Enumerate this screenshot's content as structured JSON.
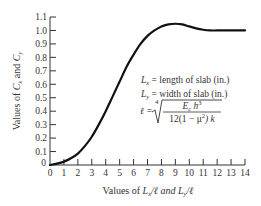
{
  "chart_data": {
    "type": "line",
    "title": "",
    "xlabel": "Values of Lx/ℓ and Ly/ℓ",
    "ylabel": "Values of Cx and Cy",
    "xlim": [
      0,
      14
    ],
    "ylim": [
      0,
      1.1
    ],
    "grid": false,
    "legend": null,
    "x_ticks": [
      0,
      1,
      2,
      3,
      4,
      5,
      6,
      7,
      8,
      9,
      10,
      11,
      12,
      13,
      14
    ],
    "x_tick_labels": [
      "0",
      "1",
      "2",
      "3",
      "4",
      "5",
      "6",
      "7",
      "8",
      "9",
      "10",
      "11",
      "12",
      "13",
      "14"
    ],
    "y_ticks": [
      0,
      0.1,
      0.2,
      0.3,
      0.4,
      0.5,
      0.6,
      0.7,
      0.8,
      0.9,
      1.0,
      1.1
    ],
    "y_tick_labels": [
      "0",
      "0.1",
      "0.2",
      "0.3",
      "0.4",
      "0.5",
      "0.6",
      "0.7",
      "0.8",
      "0.9",
      "1.0",
      "1.1"
    ],
    "series": [
      {
        "name": "C",
        "x": [
          0,
          0.5,
          1,
          1.5,
          2,
          2.5,
          3,
          3.5,
          4,
          4.5,
          5,
          5.5,
          6,
          6.5,
          7,
          7.5,
          8,
          8.5,
          9,
          9.5,
          10,
          10.5,
          11,
          11.5,
          12,
          13,
          14
        ],
        "values": [
          0,
          0.01,
          0.025,
          0.05,
          0.085,
          0.14,
          0.21,
          0.3,
          0.4,
          0.51,
          0.62,
          0.73,
          0.82,
          0.9,
          0.96,
          1.0,
          1.03,
          1.045,
          1.05,
          1.045,
          1.03,
          1.015,
          1.005,
          1.0,
          1.0,
          1.0,
          1.0
        ]
      }
    ],
    "annotations": [
      "Lx = length of slab (in.)",
      "Ly = width of slab (in.)",
      "ℓ = ⁴√( Ec h³ / (12(1 − μ²) k) )"
    ]
  },
  "labels": {
    "ylabel_prefix": "Values of ",
    "ylabel_c": "C",
    "ylabel_x": "x",
    "ylabel_and": " and ",
    "ylabel_y": "y",
    "xlabel_prefix": "Values of ",
    "xlabel_L": "L",
    "xlabel_x": "x",
    "xlabel_mid": "/ℓ and ",
    "xlabel_y": "y",
    "xlabel_end": "/ℓ",
    "annot1_rest": " = length of slab (in.)",
    "annot2_rest": " = width of slab (in.)",
    "annot_L": "L",
    "annot_x": "x",
    "annot_y": "y",
    "formula_lhs": "ℓ =",
    "formula_root_index": "4",
    "formula_num_E": "E",
    "formula_num_c": "c",
    "formula_num_h": " h",
    "formula_num_exp": "3",
    "formula_den": "12(1 − μ",
    "formula_den_exp": "2",
    "formula_den_end": ") k"
  }
}
